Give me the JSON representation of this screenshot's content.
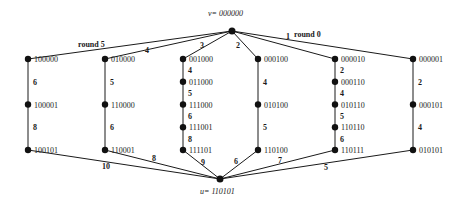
{
  "top_node": {
    "label": "v= 000000"
  },
  "bottom_node": {
    "label": "u= 110101"
  },
  "columns": [
    {
      "top_edge_label": "round 5",
      "bottom_edge_label": "10",
      "nodes": [
        "100000",
        "100001",
        "100101"
      ],
      "edge_labels": [
        "6",
        "8"
      ]
    },
    {
      "top_edge_label": "4",
      "bottom_edge_label": "8",
      "nodes": [
        "010000",
        "110000",
        "110001"
      ],
      "edge_labels": [
        "5",
        "6"
      ]
    },
    {
      "top_edge_label": "3",
      "bottom_edge_label": "9",
      "nodes": [
        "001000",
        "011000",
        "111000",
        "111001",
        "111101"
      ],
      "edge_labels": [
        "4",
        "5",
        "6",
        "8"
      ]
    },
    {
      "top_edge_label": "2",
      "bottom_edge_label": "6",
      "nodes": [
        "000100",
        "010100",
        "110100"
      ],
      "edge_labels": [
        "4",
        "5"
      ]
    },
    {
      "top_edge_label": "1",
      "bottom_edge_label": "7",
      "nodes": [
        "000010",
        "000110",
        "010110",
        "110110",
        "110111"
      ],
      "edge_labels": [
        "2",
        "4",
        "5",
        "6"
      ]
    },
    {
      "top_edge_label": "round 0",
      "bottom_edge_label": "5",
      "nodes": [
        "000001",
        "000101",
        "010101"
      ],
      "edge_labels": [
        "2",
        "4"
      ]
    }
  ]
}
